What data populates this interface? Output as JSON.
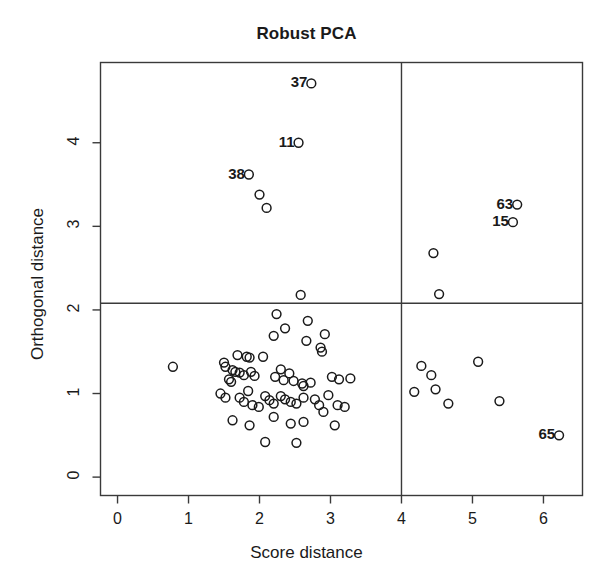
{
  "chart_data": {
    "type": "scatter",
    "title": "Robust PCA",
    "xlabel": "Score distance",
    "ylabel": "Orthogonal distance",
    "xlim": [
      -0.24,
      6.55
    ],
    "ylim": [
      -0.22,
      4.96
    ],
    "xticks": [
      0,
      1,
      2,
      3,
      4,
      5,
      6
    ],
    "yticks": [
      0,
      1,
      2,
      3,
      4
    ],
    "xtick_labels": [
      "0",
      "1",
      "2",
      "3",
      "4",
      "5",
      "6"
    ],
    "ytick_labels": [
      "0",
      "1",
      "2",
      "3",
      "4"
    ],
    "grid": false,
    "legend": null,
    "marker": "open-circle",
    "cutoff_lines": {
      "vertical_x": 4.0,
      "horizontal_y": 2.08
    },
    "labeled_points": [
      {
        "label": "37",
        "x": 2.73,
        "y": 4.71
      },
      {
        "label": "11",
        "x": 2.55,
        "y": 4.0
      },
      {
        "label": "38",
        "x": 1.85,
        "y": 3.62
      },
      {
        "label": "63",
        "x": 5.63,
        "y": 3.26
      },
      {
        "label": "15",
        "x": 5.57,
        "y": 3.05
      },
      {
        "label": "65",
        "x": 6.22,
        "y": 0.5
      }
    ],
    "points": [
      {
        "x": 2.73,
        "y": 4.71
      },
      {
        "x": 2.55,
        "y": 4.0
      },
      {
        "x": 1.85,
        "y": 3.62
      },
      {
        "x": 2.0,
        "y": 3.38
      },
      {
        "x": 2.1,
        "y": 3.22
      },
      {
        "x": 5.63,
        "y": 3.26
      },
      {
        "x": 5.57,
        "y": 3.05
      },
      {
        "x": 4.45,
        "y": 2.68
      },
      {
        "x": 2.58,
        "y": 2.18
      },
      {
        "x": 4.53,
        "y": 2.19
      },
      {
        "x": 2.24,
        "y": 1.95
      },
      {
        "x": 2.68,
        "y": 1.87
      },
      {
        "x": 2.36,
        "y": 1.78
      },
      {
        "x": 2.2,
        "y": 1.69
      },
      {
        "x": 2.92,
        "y": 1.71
      },
      {
        "x": 2.66,
        "y": 1.63
      },
      {
        "x": 2.86,
        "y": 1.55
      },
      {
        "x": 2.88,
        "y": 1.5
      },
      {
        "x": 1.69,
        "y": 1.46
      },
      {
        "x": 1.82,
        "y": 1.44
      },
      {
        "x": 1.86,
        "y": 1.43
      },
      {
        "x": 2.05,
        "y": 1.44
      },
      {
        "x": 1.5,
        "y": 1.37
      },
      {
        "x": 1.52,
        "y": 1.32
      },
      {
        "x": 0.78,
        "y": 1.32
      },
      {
        "x": 1.62,
        "y": 1.28
      },
      {
        "x": 1.66,
        "y": 1.26
      },
      {
        "x": 1.72,
        "y": 1.25
      },
      {
        "x": 1.78,
        "y": 1.22
      },
      {
        "x": 1.88,
        "y": 1.26
      },
      {
        "x": 1.93,
        "y": 1.21
      },
      {
        "x": 1.57,
        "y": 1.17
      },
      {
        "x": 1.6,
        "y": 1.14
      },
      {
        "x": 2.22,
        "y": 1.2
      },
      {
        "x": 2.3,
        "y": 1.29
      },
      {
        "x": 2.34,
        "y": 1.16
      },
      {
        "x": 2.42,
        "y": 1.24
      },
      {
        "x": 2.48,
        "y": 1.15
      },
      {
        "x": 2.6,
        "y": 1.12
      },
      {
        "x": 2.62,
        "y": 1.09
      },
      {
        "x": 2.72,
        "y": 1.13
      },
      {
        "x": 3.02,
        "y": 1.2
      },
      {
        "x": 3.12,
        "y": 1.17
      },
      {
        "x": 3.28,
        "y": 1.18
      },
      {
        "x": 4.28,
        "y": 1.33
      },
      {
        "x": 4.42,
        "y": 1.22
      },
      {
        "x": 4.48,
        "y": 1.05
      },
      {
        "x": 4.18,
        "y": 1.02
      },
      {
        "x": 4.66,
        "y": 0.88
      },
      {
        "x": 5.08,
        "y": 1.38
      },
      {
        "x": 5.38,
        "y": 0.91
      },
      {
        "x": 1.45,
        "y": 1.0
      },
      {
        "x": 1.52,
        "y": 0.95
      },
      {
        "x": 1.72,
        "y": 0.95
      },
      {
        "x": 1.78,
        "y": 0.9
      },
      {
        "x": 1.84,
        "y": 1.03
      },
      {
        "x": 1.9,
        "y": 0.86
      },
      {
        "x": 1.99,
        "y": 0.84
      },
      {
        "x": 2.08,
        "y": 0.97
      },
      {
        "x": 2.14,
        "y": 0.92
      },
      {
        "x": 2.2,
        "y": 0.88
      },
      {
        "x": 2.3,
        "y": 0.97
      },
      {
        "x": 2.36,
        "y": 0.93
      },
      {
        "x": 2.44,
        "y": 0.9
      },
      {
        "x": 2.52,
        "y": 0.88
      },
      {
        "x": 2.62,
        "y": 0.95
      },
      {
        "x": 2.78,
        "y": 0.93
      },
      {
        "x": 2.84,
        "y": 0.86
      },
      {
        "x": 2.97,
        "y": 0.98
      },
      {
        "x": 3.1,
        "y": 0.86
      },
      {
        "x": 3.2,
        "y": 0.84
      },
      {
        "x": 1.62,
        "y": 0.68
      },
      {
        "x": 1.86,
        "y": 0.62
      },
      {
        "x": 2.2,
        "y": 0.72
      },
      {
        "x": 2.44,
        "y": 0.64
      },
      {
        "x": 2.62,
        "y": 0.66
      },
      {
        "x": 2.9,
        "y": 0.78
      },
      {
        "x": 3.06,
        "y": 0.62
      },
      {
        "x": 2.08,
        "y": 0.42
      },
      {
        "x": 2.52,
        "y": 0.41
      },
      {
        "x": 6.22,
        "y": 0.5
      }
    ]
  }
}
